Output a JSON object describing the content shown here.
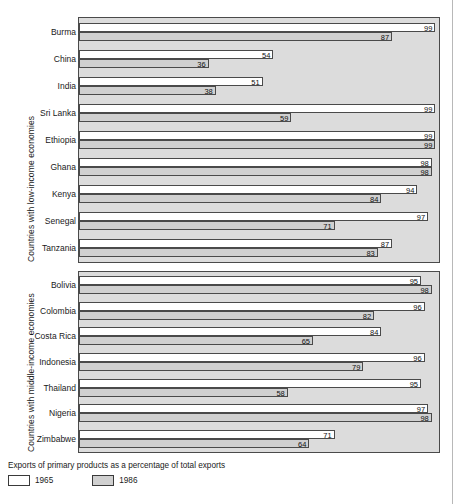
{
  "chart_data": {
    "type": "bar",
    "title": "",
    "subtitle": "",
    "xlabel": "",
    "ylabel": "",
    "xlim": [
      0,
      100
    ],
    "grid": false,
    "orientation": "horizontal",
    "legend_position": "bottom-left",
    "legend_caption": "Exports of primary products as a percentage of total exports",
    "series": [
      {
        "name": "1965",
        "color": "#ffffff"
      },
      {
        "name": "1986",
        "color": "#d0d0d0"
      }
    ],
    "panels": [
      {
        "axis_title": "Countries with low-income economies",
        "categories": [
          "Burma",
          "China",
          "India",
          "Sri Lanka",
          "Ethiopia",
          "Ghana",
          "Kenya",
          "Senegal",
          "Tanzania"
        ],
        "series": [
          {
            "name": "1965",
            "values": [
              99,
              54,
              51,
              99,
              99,
              98,
              94,
              97,
              87
            ]
          },
          {
            "name": "1986",
            "values": [
              87,
              36,
              38,
              59,
              99,
              98,
              84,
              71,
              83
            ]
          }
        ]
      },
      {
        "axis_title": "Countries with middle-income economies",
        "categories": [
          "Bolivia",
          "Colombia",
          "Costa Rica",
          "Indonesia",
          "Thailand",
          "Nigeria",
          "Zimbabwe"
        ],
        "series": [
          {
            "name": "1965",
            "values": [
              95,
              96,
              84,
              96,
              95,
              97,
              71
            ]
          },
          {
            "name": "1986",
            "values": [
              98,
              82,
              65,
              79,
              58,
              98,
              64
            ]
          }
        ]
      }
    ]
  },
  "legend": {
    "caption": "Exports of primary products as a percentage of total exports",
    "items": [
      {
        "label": "1965",
        "swatch": "white-swatch"
      },
      {
        "label": "1986",
        "swatch": "gray-swatch"
      }
    ]
  }
}
